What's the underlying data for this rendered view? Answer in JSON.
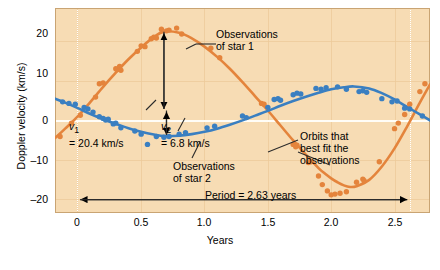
{
  "chart_data": {
    "type": "line",
    "title": "",
    "xlabel": "Years",
    "ylabel": "Doppler velocity (km/s)",
    "xlim": [
      -0.18,
      2.78
    ],
    "ylim": [
      -26,
      26
    ],
    "xticks": [
      "0",
      "0.5",
      "1.0",
      "1.5",
      "2.0",
      "2.5"
    ],
    "xtick_values": [
      0,
      0.5,
      1.0,
      1.5,
      2.0,
      2.5
    ],
    "yticks": [
      "20",
      "10",
      "0",
      "–10",
      "–20"
    ],
    "ytick_values": [
      20,
      10,
      0,
      -10,
      -20
    ],
    "grid": true,
    "legend_position": "inline-annotations",
    "series": [
      {
        "name": "Observations of star 1",
        "color": "#e4843c",
        "amplitude": 20.4,
        "mean": -0.6,
        "period": 2.63,
        "phase_peak": 0.68,
        "fit_points": [
          [
            -0.18,
            -7.0
          ],
          [
            -0.1,
            -4.6
          ],
          [
            0.0,
            -1.5
          ],
          [
            0.1,
            2.2
          ],
          [
            0.2,
            6.0
          ],
          [
            0.3,
            9.6
          ],
          [
            0.4,
            13.0
          ],
          [
            0.5,
            16.0
          ],
          [
            0.6,
            18.6
          ],
          [
            0.68,
            20.0
          ],
          [
            0.8,
            19.7
          ],
          [
            0.9,
            18.3
          ],
          [
            1.0,
            16.2
          ],
          [
            1.1,
            13.6
          ],
          [
            1.2,
            10.6
          ],
          [
            1.3,
            7.2
          ],
          [
            1.4,
            3.6
          ],
          [
            1.5,
            0.0
          ],
          [
            1.6,
            -3.8
          ],
          [
            1.7,
            -7.6
          ],
          [
            1.8,
            -11.2
          ],
          [
            1.9,
            -14.6
          ],
          [
            1.95,
            -16.0
          ],
          [
            2.0,
            -17.2
          ],
          [
            2.05,
            -18.2
          ],
          [
            2.1,
            -19.0
          ],
          [
            2.15,
            -19.4
          ],
          [
            2.2,
            -19.2
          ],
          [
            2.3,
            -17.6
          ],
          [
            2.4,
            -14.2
          ],
          [
            2.5,
            -9.6
          ],
          [
            2.6,
            -4.0
          ],
          [
            2.7,
            2.0
          ],
          [
            2.78,
            6.6
          ]
        ],
        "data_points": [
          [
            -0.14,
            -6.6
          ],
          [
            -0.05,
            -3.2
          ],
          [
            0.02,
            -1.2
          ],
          [
            0.14,
            3.4
          ],
          [
            0.17,
            6.8
          ],
          [
            0.2,
            7.0
          ],
          [
            0.3,
            10.6
          ],
          [
            0.31,
            10.4
          ],
          [
            0.33,
            11.2
          ],
          [
            0.34,
            10.2
          ],
          [
            0.47,
            15.0
          ],
          [
            0.5,
            16.4
          ],
          [
            0.53,
            16.2
          ],
          [
            0.58,
            18.2
          ],
          [
            0.6,
            18.6
          ],
          [
            0.62,
            18.4
          ],
          [
            0.66,
            20.6
          ],
          [
            0.7,
            20.2
          ],
          [
            0.72,
            20.4
          ],
          [
            0.78,
            20.9
          ],
          [
            0.82,
            19.4
          ],
          [
            1.05,
            15.8
          ],
          [
            1.12,
            13.4
          ],
          [
            1.45,
            1.8
          ],
          [
            1.47,
            1.6
          ],
          [
            1.7,
            -8.6
          ],
          [
            1.72,
            -9.2
          ],
          [
            1.73,
            -8.8
          ],
          [
            1.82,
            -13.2
          ],
          [
            1.84,
            -13.0
          ],
          [
            1.9,
            -16.6
          ],
          [
            1.93,
            -18.8
          ],
          [
            1.97,
            -20.4
          ],
          [
            2.0,
            -21.4
          ],
          [
            2.03,
            -21.2
          ],
          [
            2.07,
            -21.0
          ],
          [
            2.12,
            -20.6
          ],
          [
            2.2,
            -18.2
          ],
          [
            2.25,
            -17.4
          ],
          [
            2.26,
            -17.8
          ],
          [
            2.38,
            -13.0
          ],
          [
            2.5,
            -4.6
          ],
          [
            2.53,
            -3.2
          ],
          [
            2.58,
            -1.0
          ],
          [
            2.62,
            1.6
          ],
          [
            2.7,
            4.8
          ],
          [
            2.74,
            6.8
          ]
        ]
      },
      {
        "name": "Observations of star 2",
        "color": "#3a7fc1",
        "amplitude": 6.8,
        "mean": -0.6,
        "period": 2.63,
        "phase_trough": 0.68,
        "fit_points": [
          [
            -0.18,
            3.0
          ],
          [
            -0.1,
            2.0
          ],
          [
            0.0,
            0.6
          ],
          [
            0.1,
            -0.9
          ],
          [
            0.2,
            -2.2
          ],
          [
            0.3,
            -3.4
          ],
          [
            0.4,
            -4.5
          ],
          [
            0.5,
            -5.4
          ],
          [
            0.6,
            -6.1
          ],
          [
            0.68,
            -6.5
          ],
          [
            0.8,
            -6.4
          ],
          [
            0.9,
            -6.0
          ],
          [
            1.0,
            -5.4
          ],
          [
            1.1,
            -4.6
          ],
          [
            1.2,
            -3.6
          ],
          [
            1.3,
            -2.5
          ],
          [
            1.4,
            -1.3
          ],
          [
            1.5,
            -0.1
          ],
          [
            1.6,
            1.2
          ],
          [
            1.7,
            2.4
          ],
          [
            1.8,
            3.5
          ],
          [
            1.9,
            4.5
          ],
          [
            2.0,
            5.4
          ],
          [
            2.1,
            5.9
          ],
          [
            2.18,
            6.1
          ],
          [
            2.3,
            5.6
          ],
          [
            2.4,
            4.4
          ],
          [
            2.5,
            2.8
          ],
          [
            2.6,
            0.9
          ],
          [
            2.7,
            -1.0
          ],
          [
            2.78,
            -2.5
          ]
        ],
        "data_points": [
          [
            -0.12,
            2.2
          ],
          [
            -0.07,
            1.8
          ],
          [
            -0.02,
            1.6
          ],
          [
            0.05,
            0.8
          ],
          [
            0.08,
            0.4
          ],
          [
            0.12,
            -0.4
          ],
          [
            0.17,
            -1.6
          ],
          [
            0.2,
            -2.0
          ],
          [
            0.22,
            -2.4
          ],
          [
            0.24,
            -2.2
          ],
          [
            0.28,
            -3.4
          ],
          [
            0.3,
            -3.2
          ],
          [
            0.34,
            -4.4
          ],
          [
            0.45,
            -5.2
          ],
          [
            0.5,
            -6.0
          ],
          [
            0.55,
            -8.6
          ],
          [
            0.62,
            -6.6
          ],
          [
            0.68,
            -6.8
          ],
          [
            0.72,
            -6.6
          ],
          [
            0.8,
            -6.0
          ],
          [
            0.85,
            -5.6
          ],
          [
            1.02,
            -4.4
          ],
          [
            1.08,
            -4.0
          ],
          [
            1.3,
            -1.4
          ],
          [
            1.33,
            -1.8
          ],
          [
            1.5,
            0.8
          ],
          [
            1.55,
            2.8
          ],
          [
            1.58,
            3.0
          ],
          [
            1.6,
            2.6
          ],
          [
            1.7,
            4.0
          ],
          [
            1.73,
            4.4
          ],
          [
            1.76,
            4.2
          ],
          [
            1.88,
            5.6
          ],
          [
            1.92,
            5.4
          ],
          [
            1.96,
            5.8
          ],
          [
            2.05,
            6.0
          ],
          [
            2.12,
            5.4
          ],
          [
            2.22,
            4.8
          ],
          [
            2.25,
            5.0
          ],
          [
            2.28,
            4.6
          ],
          [
            2.4,
            3.0
          ],
          [
            2.48,
            2.2
          ],
          [
            2.52,
            2.4
          ],
          [
            2.58,
            0.6
          ],
          [
            2.62,
            0.4
          ],
          [
            2.72,
            -1.4
          ]
        ]
      }
    ],
    "annotations": [
      {
        "id": "obs-star-1",
        "text": "Observations\nof star 1"
      },
      {
        "id": "obs-star-2",
        "text": "Observations\nof star 2"
      },
      {
        "id": "orbits-fit",
        "text": "Orbits that\nbest fit the\nobservations"
      },
      {
        "id": "v1",
        "text": "= 20.4 km/s",
        "symbol": "v",
        "sub": "1"
      },
      {
        "id": "v2",
        "text": "= 6.8 km/s",
        "symbol": "v",
        "sub": "2"
      },
      {
        "id": "period",
        "text": "Period = 2.63 years"
      }
    ]
  },
  "axes": {
    "ylabel": "Doppler velocity (km/s)",
    "xlabel": "Years",
    "xticks": [
      "0",
      "0.5",
      "1.0",
      "1.5",
      "2.0",
      "2.5"
    ],
    "yticks": [
      "20",
      "10",
      "0",
      "–10",
      "–20"
    ]
  },
  "labels": {
    "obs_star1": "Observations\nof star 1",
    "obs_star2": "Observations\nof star 2",
    "orbits_fit": "Orbits that\nbest fit the\nobservations",
    "v1_symbol": "v",
    "v1_sub": "1",
    "v1_value": "= 20.4 km/s",
    "v2_symbol": "v",
    "v2_sub": "2",
    "v2_value": "= 6.8 km/s",
    "period": "Period = 2.63 years"
  },
  "colors": {
    "star1": "#e4843c",
    "star2": "#3a7fc1",
    "plot_background": "#f7dcb4",
    "gridline": "#ecc999",
    "zero_line": "#fffdf7",
    "axis_text": "#000000"
  }
}
